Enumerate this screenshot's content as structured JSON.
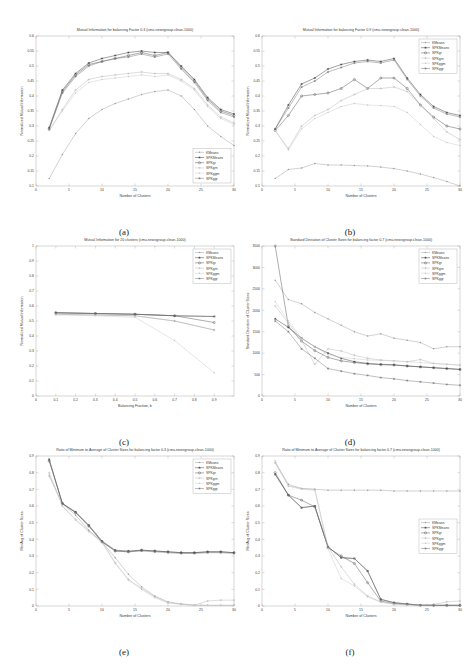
{
  "figure": {
    "dataset": "cmu-newsgroup-clean-1000",
    "panel_captions": [
      "(a)",
      "(b)",
      "(c)",
      "(d)",
      "(e)",
      "(f)"
    ],
    "series_names": [
      "KMeans",
      "SPKMeans",
      "SPKgr",
      "SPKgrn",
      "SPKggm",
      "SPKggr"
    ],
    "series_colors": [
      "#9a9a9a",
      "#2e2e2e",
      "#4a4a4a",
      "#b4b4b4",
      "#c8c8c8",
      "#6e6e6e"
    ]
  },
  "chart_data": [
    {
      "id": "a",
      "type": "line",
      "title": "Mutual Information for balancing Factor 0.3 (cmu-newsgroup-clean-1000)",
      "xlabel": "Number of Clusters",
      "ylabel": "Normalized Mutual Information",
      "xlim": [
        0,
        30
      ],
      "ylim": [
        0.1,
        0.6
      ],
      "xticks": [
        0,
        5,
        10,
        15,
        20,
        25,
        30
      ],
      "yticks": [
        0.1,
        0.15,
        0.2,
        0.25,
        0.3,
        0.35,
        0.4,
        0.45,
        0.5,
        0.55,
        0.6
      ],
      "legend_position": "bottom-right",
      "x": [
        2,
        4,
        6,
        8,
        10,
        12,
        14,
        16,
        18,
        20,
        22,
        24,
        26,
        28,
        30
      ],
      "series": [
        {
          "name": "KMeans",
          "marker": "dot",
          "values": [
            0.125,
            0.205,
            0.275,
            0.325,
            0.355,
            0.375,
            0.39,
            0.405,
            0.415,
            0.42,
            0.4,
            0.355,
            0.3,
            0.265,
            0.235
          ]
        },
        {
          "name": "SPKMeans",
          "marker": "star",
          "values": [
            0.295,
            0.42,
            0.475,
            0.51,
            0.525,
            0.535,
            0.545,
            0.55,
            0.545,
            0.545,
            0.5,
            0.455,
            0.395,
            0.355,
            0.34
          ]
        },
        {
          "name": "SPKgr",
          "marker": "circle",
          "values": [
            0.29,
            0.415,
            0.47,
            0.505,
            0.515,
            0.525,
            0.535,
            0.545,
            0.535,
            0.545,
            0.495,
            0.45,
            0.39,
            0.35,
            0.335
          ]
        },
        {
          "name": "SPKgrn",
          "marker": "plus",
          "values": [
            0.285,
            0.355,
            0.42,
            0.455,
            0.465,
            0.47,
            0.475,
            0.48,
            0.475,
            0.475,
            0.455,
            0.425,
            0.37,
            0.33,
            0.31
          ]
        },
        {
          "name": "SPKggm",
          "marker": "dot",
          "values": [
            0.285,
            0.35,
            0.41,
            0.445,
            0.455,
            0.46,
            0.465,
            0.47,
            0.465,
            0.47,
            0.45,
            0.42,
            0.365,
            0.325,
            0.305
          ]
        },
        {
          "name": "SPKggr",
          "marker": "star",
          "values": [
            0.29,
            0.41,
            0.465,
            0.5,
            0.515,
            0.525,
            0.53,
            0.54,
            0.53,
            0.54,
            0.49,
            0.445,
            0.385,
            0.345,
            0.33
          ]
        }
      ]
    },
    {
      "id": "b",
      "type": "line",
      "title": "Mutual Information for balancing Factor 0.9 (cmu-newsgroup-clean-1000)",
      "xlabel": "Number of Clusters",
      "ylabel": "Normalized Mutual Information",
      "xlim": [
        0,
        30
      ],
      "ylim": [
        0.1,
        0.6
      ],
      "xticks": [
        0,
        5,
        10,
        15,
        20,
        25,
        30
      ],
      "yticks": [
        0.1,
        0.15,
        0.2,
        0.25,
        0.3,
        0.35,
        0.4,
        0.45,
        0.5,
        0.55,
        0.6
      ],
      "legend_position": "top-right",
      "x": [
        2,
        4,
        6,
        8,
        10,
        12,
        14,
        16,
        18,
        20,
        22,
        24,
        26,
        28,
        30
      ],
      "series": [
        {
          "name": "KMeans",
          "marker": "dot",
          "values": [
            0.125,
            0.155,
            0.16,
            0.175,
            0.17,
            0.17,
            0.168,
            0.167,
            0.163,
            0.158,
            0.15,
            0.14,
            0.128,
            0.115,
            0.1
          ]
        },
        {
          "name": "SPKMeans",
          "marker": "star",
          "values": [
            0.29,
            0.37,
            0.44,
            0.46,
            0.49,
            0.505,
            0.515,
            0.52,
            0.515,
            0.525,
            0.46,
            0.405,
            0.365,
            0.345,
            0.335
          ]
        },
        {
          "name": "SPKgr",
          "marker": "circle",
          "values": [
            0.285,
            0.335,
            0.4,
            0.405,
            0.41,
            0.425,
            0.455,
            0.425,
            0.46,
            0.46,
            0.425,
            0.37,
            0.33,
            0.3,
            0.29
          ]
        },
        {
          "name": "SPKgrn",
          "marker": "plus",
          "values": [
            0.285,
            0.225,
            0.3,
            0.335,
            0.355,
            0.385,
            0.405,
            0.425,
            0.425,
            0.43,
            0.415,
            0.37,
            0.325,
            0.28,
            0.255
          ]
        },
        {
          "name": "SPKggm",
          "marker": "dot",
          "values": [
            0.285,
            0.22,
            0.29,
            0.325,
            0.345,
            0.365,
            0.375,
            0.37,
            0.368,
            0.365,
            0.345,
            0.305,
            0.265,
            0.245,
            0.235
          ]
        },
        {
          "name": "SPKggr",
          "marker": "star",
          "values": [
            0.29,
            0.36,
            0.43,
            0.45,
            0.48,
            0.495,
            0.51,
            0.515,
            0.51,
            0.52,
            0.455,
            0.4,
            0.36,
            0.34,
            0.33
          ]
        }
      ]
    },
    {
      "id": "c",
      "type": "line",
      "title": "Mutual Information for 20 clusters (cmu-newsgroup-clean-1000)",
      "xlabel": "Balancing Fraction, b",
      "ylabel": "Normalized Mutual Information",
      "xlim": [
        0,
        1.0
      ],
      "ylim": [
        0,
        1.0
      ],
      "xticks": [
        0,
        0.1,
        0.2,
        0.3,
        0.4,
        0.5,
        0.6,
        0.7,
        0.8,
        0.9
      ],
      "yticks": [
        0,
        0.1,
        0.2,
        0.3,
        0.4,
        0.5,
        0.6,
        0.7,
        0.8,
        0.9,
        1.0
      ],
      "legend_position": "top-right",
      "x": [
        0.1,
        0.3,
        0.5,
        0.7,
        0.9
      ],
      "series": [
        {
          "name": "KMeans",
          "marker": "dot",
          "values": [
            0.545,
            0.54,
            0.535,
            0.5,
            0.44
          ]
        },
        {
          "name": "SPKMeans",
          "marker": "star",
          "values": [
            0.555,
            0.55,
            0.545,
            0.535,
            0.53
          ]
        },
        {
          "name": "SPKgr",
          "marker": "circle",
          "values": [
            0.555,
            0.55,
            0.545,
            0.535,
            0.49
          ]
        },
        {
          "name": "SPKgrn",
          "marker": "plus",
          "values": [
            0.545,
            0.54,
            0.535,
            0.5,
            0.44
          ]
        },
        {
          "name": "SPKggm",
          "marker": "dot",
          "values": [
            0.54,
            0.535,
            0.525,
            0.37,
            0.155
          ]
        },
        {
          "name": "SPKggr",
          "marker": "star",
          "values": [
            0.555,
            0.55,
            0.545,
            0.535,
            0.53
          ]
        }
      ]
    },
    {
      "id": "d",
      "type": "line",
      "title": "Standard Deviation of Cluster Sizes for balancing factor 0.7 (cmu-newsgroup-clean-1000)",
      "xlabel": "Number of Clusters",
      "ylabel": "Standard Deviation of Cluster Sizes",
      "xlim": [
        0,
        30
      ],
      "ylim": [
        0,
        3500
      ],
      "xticks": [
        0,
        5,
        10,
        15,
        20,
        25,
        30
      ],
      "yticks": [
        0,
        500,
        1000,
        1500,
        2000,
        2500,
        3000,
        3500
      ],
      "legend_position": "top-right",
      "x": [
        2,
        4,
        6,
        8,
        10,
        12,
        14,
        16,
        18,
        20,
        22,
        24,
        26,
        28,
        30
      ],
      "series": [
        {
          "name": "KMeans",
          "marker": "dot",
          "values": [
            2700,
            2250,
            2150,
            1950,
            1800,
            1650,
            1500,
            1400,
            1450,
            1350,
            1300,
            1250,
            1100,
            1150,
            1150
          ]
        },
        {
          "name": "SPKMeans",
          "marker": "star",
          "values": [
            1800,
            1600,
            1350,
            1150,
            1000,
            880,
            800,
            760,
            740,
            730,
            700,
            680,
            660,
            640,
            620
          ]
        },
        {
          "name": "SPKgr",
          "marker": "circle",
          "values": [
            3500,
            1620,
            1280,
            1060,
            900,
            820,
            780,
            750,
            730,
            720,
            700,
            680,
            660,
            640,
            620
          ]
        },
        {
          "name": "SPKgrn",
          "marker": "plus",
          "values": [
            2100,
            1700,
            1300,
            740,
            1100,
            1050,
            950,
            880,
            840,
            820,
            800,
            850,
            760,
            740,
            720
          ]
        },
        {
          "name": "SPKggm",
          "marker": "dot",
          "values": [
            2200,
            1750,
            1350,
            1150,
            960,
            900,
            870,
            840,
            830,
            820,
            800,
            780,
            760,
            740,
            720
          ]
        },
        {
          "name": "SPKggr",
          "marker": "star",
          "values": [
            1750,
            1500,
            1100,
            880,
            640,
            580,
            520,
            480,
            430,
            400,
            360,
            330,
            300,
            270,
            250
          ]
        }
      ]
    },
    {
      "id": "e",
      "type": "line",
      "title": "Ratio of Minimum to Average of Cluster Sizes for balancing factor 0.3 (cmu-newsgroup-clean-1000)",
      "xlabel": "Number of Clusters",
      "ylabel": "Min/Avg of Cluster Sizes",
      "xlim": [
        0,
        30
      ],
      "ylim": [
        0,
        0.9
      ],
      "xticks": [
        0,
        5,
        10,
        15,
        20,
        25,
        30
      ],
      "yticks": [
        0,
        0.1,
        0.2,
        0.3,
        0.4,
        0.5,
        0.6,
        0.7,
        0.8,
        0.9
      ],
      "legend_position": "top-right",
      "x": [
        2,
        4,
        6,
        8,
        10,
        12,
        14,
        16,
        18,
        20,
        22,
        24,
        26,
        28,
        30
      ],
      "series": [
        {
          "name": "KMeans",
          "marker": "dot",
          "values": [
            0.78,
            0.615,
            0.545,
            0.455,
            0.385,
            0.29,
            0.19,
            0.115,
            0.06,
            0.025,
            0.012,
            0.005,
            0.004,
            0.004,
            0.004
          ]
        },
        {
          "name": "SPKMeans",
          "marker": "star",
          "values": [
            0.88,
            0.615,
            0.565,
            0.485,
            0.39,
            0.335,
            0.33,
            0.335,
            0.33,
            0.325,
            0.32,
            0.32,
            0.325,
            0.325,
            0.32
          ]
        },
        {
          "name": "SPKgr",
          "marker": "circle",
          "values": [
            0.87,
            0.615,
            0.56,
            0.48,
            0.385,
            0.33,
            0.325,
            0.335,
            0.33,
            0.325,
            0.32,
            0.32,
            0.325,
            0.325,
            0.32
          ]
        },
        {
          "name": "SPKgrn",
          "marker": "plus",
          "values": [
            0.8,
            0.6,
            0.52,
            0.45,
            0.385,
            0.26,
            0.16,
            0.105,
            0.055,
            0.02,
            0.012,
            0.005,
            0.03,
            0.035,
            0.035
          ]
        },
        {
          "name": "SPKggm",
          "marker": "dot",
          "values": [
            0.79,
            0.6,
            0.515,
            0.445,
            0.38,
            0.255,
            0.155,
            0.1,
            0.05,
            0.018,
            0.01,
            0.004,
            0.004,
            0.004,
            0.004
          ]
        },
        {
          "name": "SPKggr",
          "marker": "star",
          "values": [
            0.875,
            0.615,
            0.56,
            0.48,
            0.385,
            0.33,
            0.325,
            0.33,
            0.325,
            0.32,
            0.315,
            0.315,
            0.32,
            0.32,
            0.315
          ]
        }
      ]
    },
    {
      "id": "f",
      "type": "line",
      "title": "Ratio of Minimum to Average of Cluster Sizes for balancing factor 0.7 (cmu-newsgroup-clean-1000)",
      "xlabel": "Number of Clusters",
      "ylabel": "Min/Avg of Cluster Sizes",
      "xlim": [
        0,
        30
      ],
      "ylim": [
        0,
        0.9
      ],
      "xticks": [
        0,
        5,
        10,
        15,
        20,
        25,
        30
      ],
      "yticks": [
        0,
        0.1,
        0.2,
        0.3,
        0.4,
        0.5,
        0.6,
        0.7,
        0.8,
        0.9
      ],
      "legend_position": "middle-right",
      "x": [
        2,
        4,
        6,
        8,
        10,
        12,
        14,
        16,
        18,
        20,
        22,
        24,
        26,
        28,
        30
      ],
      "series": [
        {
          "name": "KMeans",
          "marker": "dot",
          "values": [
            0.86,
            0.73,
            0.705,
            0.7,
            0.695,
            0.695,
            0.695,
            0.695,
            0.695,
            0.69,
            0.69,
            0.69,
            0.69,
            0.69,
            0.69
          ]
        },
        {
          "name": "SPKMeans",
          "marker": "star",
          "values": [
            0.79,
            0.665,
            0.59,
            0.6,
            0.355,
            0.29,
            0.285,
            0.21,
            0.04,
            0.02,
            0.012,
            0.005,
            0.004,
            0.004,
            0.004
          ]
        },
        {
          "name": "SPKgr",
          "marker": "circle",
          "values": [
            0.8,
            0.665,
            0.635,
            0.595,
            0.35,
            0.3,
            0.255,
            0.14,
            0.03,
            0.015,
            0.01,
            0.004,
            0.004,
            0.004,
            0.004
          ]
        },
        {
          "name": "SPKgrn",
          "marker": "plus",
          "values": [
            0.87,
            0.72,
            0.705,
            0.7,
            0.355,
            0.235,
            0.13,
            0.06,
            0.025,
            0.012,
            0.008,
            0.004,
            0.01,
            0.025,
            0.03
          ]
        },
        {
          "name": "SPKggm",
          "marker": "dot",
          "values": [
            0.855,
            0.72,
            0.7,
            0.695,
            0.345,
            0.165,
            0.12,
            0.055,
            0.022,
            0.01,
            0.006,
            0.004,
            0.004,
            0.004,
            0.004
          ]
        },
        {
          "name": "SPKggr",
          "marker": "star",
          "values": [
            0.79,
            0.665,
            0.59,
            0.6,
            0.355,
            0.29,
            0.285,
            0.21,
            0.04,
            0.02,
            0.012,
            0.005,
            0.004,
            0.004,
            0.004
          ]
        }
      ]
    }
  ]
}
